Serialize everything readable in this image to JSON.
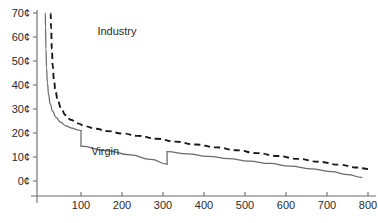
{
  "chart_data": {
    "type": "line",
    "title": "",
    "subtitle": "",
    "xlabel": "",
    "ylabel": "",
    "xlim": [
      0,
      830
    ],
    "ylim": [
      0,
      70
    ],
    "grid": false,
    "legend_position": "inline-annotation",
    "y_tick_labels": [
      "0¢",
      "10¢",
      "20¢",
      "30¢",
      "40¢",
      "50¢",
      "60¢",
      "70¢"
    ],
    "y_tick_values": [
      0,
      10,
      20,
      30,
      40,
      50,
      60,
      70
    ],
    "x_tick_labels": [
      "100",
      "200",
      "300",
      "400",
      "500",
      "600",
      "700",
      "800"
    ],
    "x_tick_values": [
      100,
      200,
      300,
      400,
      500,
      600,
      700,
      800
    ],
    "annotations": [
      {
        "text": "Industry",
        "x": 140,
        "y": 61
      },
      {
        "text": "Virgin",
        "x": 125,
        "y": 11
      }
    ],
    "series": [
      {
        "name": "Industry",
        "style": "dashed",
        "color": "#1a1a1a",
        "points": [
          [
            26,
            70
          ],
          [
            27,
            64
          ],
          [
            29,
            55
          ],
          [
            31,
            48
          ],
          [
            34,
            42
          ],
          [
            38,
            37
          ],
          [
            44,
            33
          ],
          [
            52,
            30
          ],
          [
            62,
            27.5
          ],
          [
            75,
            25.5
          ],
          [
            92,
            24.0
          ],
          [
            110,
            22.8
          ],
          [
            135,
            21.8
          ],
          [
            165,
            20.8
          ],
          [
            200,
            19.8
          ],
          [
            240,
            18.8
          ],
          [
            285,
            17.6
          ],
          [
            330,
            16.4
          ],
          [
            380,
            15.2
          ],
          [
            430,
            14.0
          ],
          [
            480,
            12.8
          ],
          [
            530,
            11.6
          ],
          [
            580,
            10.4
          ],
          [
            630,
            9.2
          ],
          [
            680,
            8.0
          ],
          [
            730,
            6.8
          ],
          [
            775,
            5.6
          ],
          [
            800,
            5.0
          ]
        ]
      },
      {
        "name": "Virgin",
        "style": "solid",
        "color": "#6a6a6a",
        "segments": [
          {
            "points": [
              [
                13,
                70
              ],
              [
                13.5,
                64
              ],
              [
                14.5,
                55
              ],
              [
                16,
                47
              ],
              [
                18,
                41
              ],
              [
                21,
                36
              ],
              [
                25,
                32
              ],
              [
                31,
                29
              ],
              [
                39,
                26.5
              ],
              [
                50,
                24.5
              ],
              [
                63,
                23.0
              ],
              [
                78,
                22.0
              ],
              [
                92,
                21.3
              ],
              [
                100,
                21.0
              ]
            ]
          },
          {
            "drop_at_x": 100,
            "from_y": 21.0,
            "to_y": 14.5
          },
          {
            "points": [
              [
                100,
                14.5
              ],
              [
                160,
                12.7
              ],
              [
                220,
                10.9
              ],
              [
                270,
                9.0
              ],
              [
                310,
                7.0
              ]
            ]
          },
          {
            "drop_at_x": 310,
            "from_y": 7.0,
            "to_y": 12.2
          },
          {
            "points": [
              [
                310,
                12.2
              ],
              [
                360,
                11.3
              ],
              [
                410,
                10.3
              ],
              [
                460,
                9.3
              ],
              [
                510,
                8.3
              ],
              [
                560,
                7.3
              ],
              [
                610,
                6.2
              ],
              [
                660,
                5.1
              ],
              [
                710,
                3.9
              ],
              [
                750,
                2.7
              ],
              [
                785,
                1.5
              ]
            ]
          }
        ]
      }
    ]
  },
  "axes": {
    "y_axis_name": "price-axis",
    "x_axis_name": "quantity-axis"
  }
}
